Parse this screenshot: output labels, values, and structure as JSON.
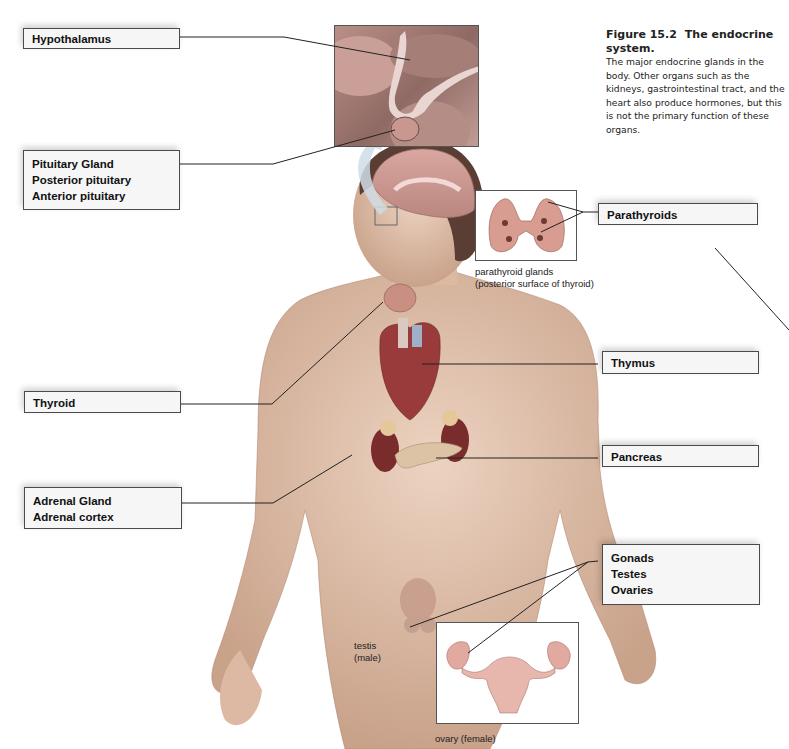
{
  "figure": {
    "number": "Figure 15.2",
    "title": "The endocrine system.",
    "caption": "The major endocrine glands in the body. Other organs such as the kidneys, gastrointestinal tract, and the heart also produce hormones, but this is not the primary function of these organs."
  },
  "labels": {
    "hypothalamus": [
      "Hypothalamus"
    ],
    "pituitary": [
      "Pituitary Gland",
      "Posterior pituitary",
      "Anterior pituitary"
    ],
    "thyroid": [
      "Thyroid"
    ],
    "adrenal": [
      "Adrenal Gland",
      "Adrenal cortex"
    ],
    "parathyroids": [
      "Parathyroids"
    ],
    "thymus": [
      "Thymus"
    ],
    "pancreas": [
      "Pancreas"
    ],
    "gonads": [
      "Gonads",
      "Testes",
      "Ovaries"
    ]
  },
  "sub_captions": {
    "parathyroid_line1": "parathyroid glands",
    "parathyroid_line2": "(posterior surface of thyroid)",
    "testis_line1": "testis",
    "testis_line2": "(male)",
    "ovary": "ovary (female)"
  },
  "colors": {
    "skin": "#e2c3ae",
    "organ_red": "#9a3b3b",
    "gland_tan": "#d7b59c",
    "label_fill": "#f6f6f6",
    "leader_line": "#222222"
  }
}
